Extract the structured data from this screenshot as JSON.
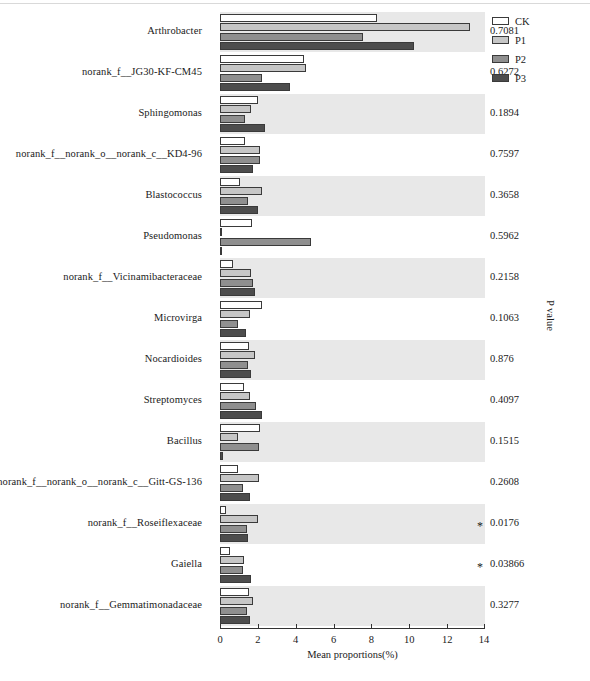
{
  "chart_data": {
    "type": "bar",
    "orientation": "horizontal",
    "title": "",
    "xlabel": "Mean proportions(%)",
    "ylabel": "",
    "right_axis_label": "P value",
    "xlim": [
      0,
      14
    ],
    "xticks": [
      0,
      2,
      4,
      6,
      8,
      10,
      12,
      14
    ],
    "xticklabels": [
      "0",
      "2",
      "4",
      "6",
      "8",
      "10",
      "12",
      "14"
    ],
    "grid": false,
    "legend_position": "top-right",
    "legend": [
      "CK",
      "P1",
      "P2",
      "P3"
    ],
    "series": [
      {
        "name": "CK",
        "color": "#ffffff",
        "values": [
          8.3,
          4.45,
          2.0,
          1.32,
          1.06,
          1.69,
          0.69,
          2.22,
          1.53,
          1.27,
          2.11,
          0.95,
          0.32,
          0.53,
          1.53
        ]
      },
      {
        "name": "P1",
        "color": "#c6c6c6",
        "values": [
          13.2,
          4.55,
          1.64,
          2.11,
          2.22,
          0.06,
          1.64,
          1.58,
          1.85,
          1.58,
          0.95,
          2.06,
          2.01,
          1.27,
          1.74
        ]
      },
      {
        "name": "P2",
        "color": "#8f8f8f",
        "values": [
          7.55,
          2.22,
          1.32,
          2.11,
          1.48,
          4.8,
          1.74,
          0.95,
          1.48,
          1.9,
          2.06,
          1.22,
          1.43,
          1.22,
          1.43
        ]
      },
      {
        "name": "P3",
        "color": "#4d4d4d",
        "values": [
          10.26,
          3.7,
          2.38,
          1.74,
          2.01,
          0.11,
          1.85,
          1.37,
          1.64,
          2.22,
          0.16,
          1.58,
          1.48,
          1.64,
          1.58
        ]
      }
    ],
    "categories": [
      "Arthrobacter",
      "norank_f__JG30-KF-CM45",
      "Sphingomonas",
      "norank_f__norank_o__norank_c__KD4-96",
      "Blastococcus",
      "Pseudomonas",
      "norank_f__Vicinamibacteraceae",
      "Microvirga",
      "Nocardioides",
      "Streptomyces",
      "Bacillus",
      "norank_f__norank_o__norank_c__Gitt-GS-136",
      "norank_f__Roseiflexaceae",
      "Gaiella",
      "norank_f__Gemmatimonadaceae"
    ],
    "p_values": [
      "0.7081",
      "0.6272",
      "0.1894",
      "0.7597",
      "0.3658",
      "0.5962",
      "0.2158",
      "0.1063",
      "0.876",
      "0.4097",
      "0.1515",
      "0.2608",
      "0.0176",
      "0.03866",
      "0.3277"
    ],
    "significance_markers": [
      "",
      "",
      "",
      "",
      "",
      "",
      "",
      "",
      "",
      "",
      "",
      "",
      "*",
      "*",
      ""
    ]
  },
  "legend": {
    "items": [
      {
        "label": "CK",
        "swatch": "ck"
      },
      {
        "label": "P1",
        "swatch": "p1"
      },
      {
        "label": "P2",
        "swatch": "p2"
      },
      {
        "label": "P3",
        "swatch": "p3"
      }
    ]
  },
  "axes": {
    "x_title": "Mean proportions(%)",
    "p_title": "P value"
  }
}
